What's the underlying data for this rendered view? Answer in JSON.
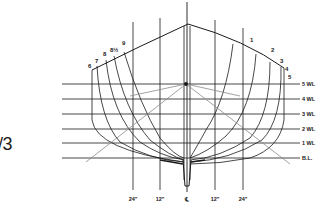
{
  "diagram": {
    "type": "hull-body-plan",
    "left_fragment_text": "/3",
    "station_labels_left": [
      "6",
      "7",
      "8",
      "8½",
      "9"
    ],
    "station_labels_right": [
      "1",
      "2",
      "3",
      "4",
      "5"
    ],
    "waterline_labels": [
      "5 WL",
      "4 WL",
      "3 WL",
      "2 WL",
      "1 WL",
      "B.L."
    ],
    "bottom_labels": [
      "24\"",
      "12\"",
      "℄",
      "12\"",
      "24\""
    ],
    "colors": {
      "line": "#1a1a1a",
      "diagonal": "#8a8a8a",
      "background": "#ffffff"
    }
  }
}
